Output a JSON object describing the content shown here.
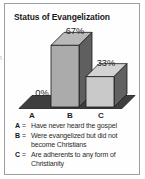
{
  "page": {
    "edge_fragment": "n"
  },
  "chart_data": {
    "type": "bar",
    "style": "3d",
    "title": "Status of Evangelization",
    "categories": [
      "A",
      "B",
      "C"
    ],
    "values": [
      0,
      67,
      33
    ],
    "value_labels": [
      "0%",
      "67%",
      "33%"
    ],
    "xlabel": "",
    "ylabel": "",
    "ylim": [
      0,
      100
    ],
    "grid": false,
    "legend_position": "bottom",
    "colors": {
      "floor": "#3e3e3e",
      "front": [
        "#3e3e3e",
        "#ababab",
        "#c9c9c9"
      ],
      "top": [
        "#3e3e3e",
        "#b9b9b9",
        "#d3d3d3"
      ],
      "side": [
        "#3e3e3e",
        "#5f5f5f",
        "#616161"
      ],
      "outline": "#1b1b1b",
      "label": "#1f1f1f"
    },
    "legend": {
      "sep": "=",
      "entries": [
        {
          "key": "A",
          "text": "Have never heard the gospel"
        },
        {
          "key": "B",
          "text": "Were evangelized but did not become Christians"
        },
        {
          "key": "C",
          "text": "Are adherents to any form of Christianity"
        }
      ]
    }
  }
}
